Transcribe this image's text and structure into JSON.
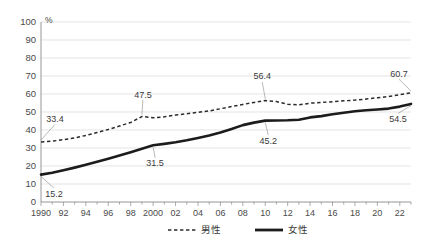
{
  "chart_data": {
    "type": "line",
    "title": "",
    "subtitle": "",
    "xlabel": "",
    "ylabel": "",
    "unit_label": "%",
    "ylim": [
      0,
      100
    ],
    "ytick_step": 10,
    "yticks": [
      "0",
      "10",
      "20",
      "30",
      "40",
      "50",
      "60",
      "70",
      "80",
      "90",
      "100"
    ],
    "xlim": [
      1990,
      2023
    ],
    "grid": "horizontal",
    "legend_position": "bottom",
    "x": [
      1990,
      1991,
      1992,
      1993,
      1994,
      1995,
      1996,
      1997,
      1998,
      1999,
      2000,
      2001,
      2002,
      2003,
      2004,
      2005,
      2006,
      2007,
      2008,
      2009,
      2010,
      2011,
      2012,
      2013,
      2014,
      2015,
      2016,
      2017,
      2018,
      2019,
      2020,
      2021,
      2022,
      2023
    ],
    "xtick_labels": [
      "1990",
      "92",
      "94",
      "96",
      "98",
      "2000",
      "02",
      "04",
      "06",
      "08",
      "10",
      "12",
      "14",
      "16",
      "18",
      "20",
      "22"
    ],
    "xtick_label_years": [
      1990,
      1992,
      1994,
      1996,
      1998,
      2000,
      2002,
      2004,
      2006,
      2008,
      2010,
      2012,
      2014,
      2016,
      2018,
      2020,
      2022
    ],
    "series": [
      {
        "name": "男性",
        "style": "dashed",
        "color": "#2b2b2b",
        "values": [
          33.4,
          33.8,
          34.6,
          35.6,
          37.0,
          38.6,
          40.3,
          42.2,
          44.2,
          47.5,
          46.8,
          47.3,
          48.3,
          49.0,
          49.8,
          50.6,
          51.8,
          53.0,
          54.2,
          55.3,
          56.4,
          55.8,
          54.3,
          54.0,
          54.9,
          55.3,
          55.7,
          56.2,
          56.6,
          57.2,
          57.9,
          58.6,
          59.6,
          60.7
        ]
      },
      {
        "name": "女性",
        "style": "solid",
        "color": "#1c1c1c",
        "values": [
          15.2,
          16.2,
          17.6,
          19.1,
          20.7,
          22.3,
          24.0,
          25.8,
          27.7,
          29.6,
          31.5,
          32.3,
          33.2,
          34.3,
          35.6,
          36.9,
          38.6,
          40.6,
          42.7,
          44.1,
          45.2,
          45.3,
          45.4,
          45.7,
          47.0,
          47.7,
          48.7,
          49.6,
          50.4,
          51.0,
          51.4,
          51.9,
          53.0,
          54.5
        ]
      }
    ],
    "annotations": [
      {
        "text": "33.4",
        "year": 1990,
        "value": 33.4,
        "series": "男性"
      },
      {
        "text": "47.5",
        "year": 1999,
        "value": 47.5,
        "series": "男性"
      },
      {
        "text": "56.4",
        "year": 2010,
        "value": 56.4,
        "series": "男性"
      },
      {
        "text": "60.7",
        "year": 2023,
        "value": 60.7,
        "series": "男性"
      },
      {
        "text": "15.2",
        "year": 1990,
        "value": 15.2,
        "series": "女性"
      },
      {
        "text": "31.5",
        "year": 2000,
        "value": 31.5,
        "series": "女性"
      },
      {
        "text": "45.2",
        "year": 2010,
        "value": 45.2,
        "series": "女性"
      },
      {
        "text": "54.5",
        "year": 2023,
        "value": 54.5,
        "series": "女性"
      }
    ],
    "legend": [
      {
        "label": "男性",
        "style": "dashed"
      },
      {
        "label": "女性",
        "style": "solid"
      }
    ]
  }
}
